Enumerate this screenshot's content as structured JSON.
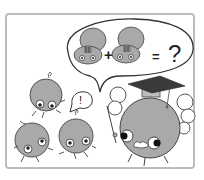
{
  "illustration": {
    "description": "Cartoon: a professor blob character with a graduation cap thinks about an equation; three small blob characters look on, one exclaiming",
    "thought_bubble": {
      "equation": {
        "term1": "cartoon-critter",
        "operator_plus": "+",
        "term2": "cartoon-critter",
        "operator_equals": "=",
        "result": "?"
      }
    },
    "speech_bubble": {
      "text": "!"
    },
    "characters": [
      "blob-exclaiming",
      "blob-left",
      "blob-middle",
      "professor-blob"
    ],
    "colors": {
      "frame": "#bdbdbd",
      "body_fill": "#a9a9a9",
      "outline": "#333333",
      "cap": "#3a3a3a",
      "background": "#ffffff"
    }
  }
}
